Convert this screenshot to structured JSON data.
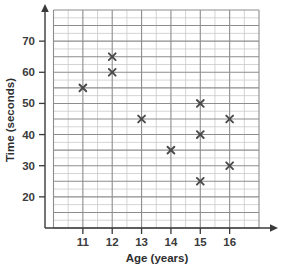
{
  "chart_data": {
    "type": "scatter",
    "title": "",
    "xlabel": "Age (years)",
    "ylabel": "Time (seconds)",
    "xlim": [
      10,
      17
    ],
    "ylim": [
      10,
      80
    ],
    "xticks": [
      "11",
      "12",
      "13",
      "14",
      "15",
      "16"
    ],
    "yticks": [
      "20",
      "30",
      "40",
      "50",
      "60",
      "70"
    ],
    "grid": true,
    "legend": "none",
    "marker": "x",
    "marker_color": "#4a4a4a",
    "x": [
      11,
      12,
      12,
      13,
      14,
      15,
      15,
      15,
      16,
      16
    ],
    "y": [
      55,
      65,
      60,
      45,
      35,
      50,
      40,
      25,
      45,
      30
    ],
    "points": [
      {
        "x": 11,
        "y": 55
      },
      {
        "x": 12,
        "y": 65
      },
      {
        "x": 12,
        "y": 60
      },
      {
        "x": 13,
        "y": 45
      },
      {
        "x": 14,
        "y": 35
      },
      {
        "x": 15,
        "y": 50
      },
      {
        "x": 15,
        "y": 40
      },
      {
        "x": 15,
        "y": 25
      },
      {
        "x": 16,
        "y": 45
      },
      {
        "x": 16,
        "y": 30
      }
    ]
  },
  "axes": {
    "x_title": "Age (years)",
    "y_title": "Time (seconds)",
    "x_tick_labels": [
      "11",
      "12",
      "13",
      "14",
      "15",
      "16"
    ],
    "y_tick_labels": [
      "20",
      "30",
      "40",
      "50",
      "60",
      "70"
    ]
  },
  "colors": {
    "background": "#ffffff",
    "grid_minor": "#c9c9c9",
    "grid_major": "#8d8d8d",
    "axis": "#3a3a3a",
    "marker": "#4a4a4a",
    "text": "#2e2e2e"
  }
}
